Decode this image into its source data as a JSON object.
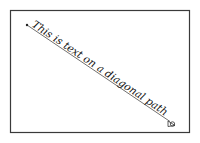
{
  "diagram": {
    "text_on_path": "This is text on a diagonal path",
    "colors": {
      "frame": "#3a3a3a",
      "line": "#333333",
      "text": "#111111",
      "background": "#ffffff"
    },
    "path": {
      "start_marker": "dot",
      "end_marker": "arrowhead"
    }
  }
}
